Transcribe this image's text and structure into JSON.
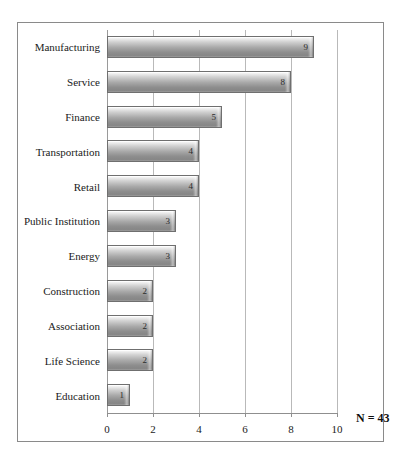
{
  "chart_data": {
    "type": "bar",
    "orientation": "horizontal",
    "title": "",
    "subtitle": "",
    "xlabel": "",
    "ylabel": "",
    "categories": [
      "Manufacturing",
      "Service",
      "Finance",
      "Transportation",
      "Retail",
      "Public Institution",
      "Energy",
      "Construction",
      "Association",
      "Life Science",
      "Education"
    ],
    "values": [
      9,
      8,
      5,
      4,
      4,
      3,
      3,
      2,
      2,
      2,
      1
    ],
    "data_labels": [
      "9",
      "8",
      "5",
      "4",
      "4",
      "3",
      "3",
      "2",
      "2",
      "2",
      "1"
    ],
    "xlim": [
      0,
      10
    ],
    "xticks": [
      0,
      2,
      4,
      6,
      8,
      10
    ],
    "xtick_labels": [
      "0",
      "2",
      "4",
      "6",
      "8",
      "10"
    ],
    "grid": "vertical",
    "legend": "none",
    "annotations": [
      {
        "name": "sample-size",
        "text": "N = 43",
        "position": "bottom-right"
      }
    ],
    "colors": {
      "bar_fill_light": "#fbfbfb",
      "bar_fill_mid": "#a9a9a9",
      "bar_fill_dark": "#868686",
      "bar_border": "#6f6f6f",
      "gridline": "#b9b9b9",
      "axis": "#8f8f8f",
      "frame": "#8a8a8a",
      "background": "#ffffff",
      "text": "#1a1a1a"
    }
  }
}
